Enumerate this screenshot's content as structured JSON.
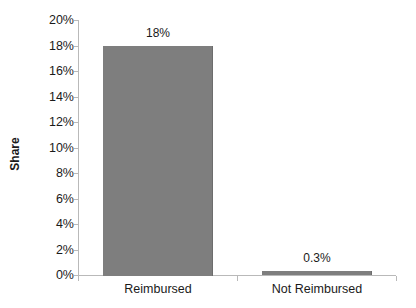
{
  "chart_data": {
    "type": "bar",
    "title": "",
    "subtitle": "",
    "xlabel": "",
    "ylabel": "Share",
    "categories": [
      "Reimbursed",
      "Not Reimbursed"
    ],
    "values": [
      18,
      0.3
    ],
    "value_labels": [
      "18%",
      "0.3%"
    ],
    "ylim": [
      0,
      20
    ],
    "ytick_values": [
      0,
      2,
      4,
      6,
      8,
      10,
      12,
      14,
      16,
      18,
      20
    ],
    "ytick_labels": [
      "0%",
      "2%",
      "4%",
      "6%",
      "8%",
      "10%",
      "12%",
      "14%",
      "16%",
      "18%",
      "20%"
    ],
    "grid": false,
    "legend": false,
    "legend_position": "none",
    "bar_color": "#7e7e7e",
    "axis_color": "#b9b9b9",
    "text_color": "#1a1a1a",
    "background": "#ffffff"
  },
  "axis": {
    "y_title": "Share"
  }
}
